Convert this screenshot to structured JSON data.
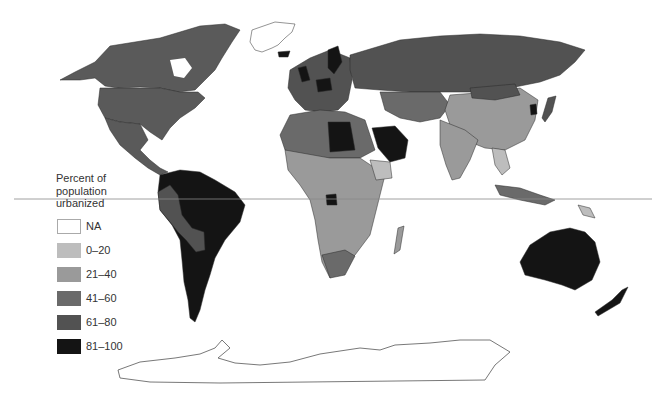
{
  "map": {
    "title": "Percent of population urbanized",
    "projection": "world (equirectangular-like)",
    "equator_line": {
      "y": 199,
      "x_start": 14,
      "x_end": 652,
      "color": "#888888"
    }
  },
  "legend": {
    "title_lines": [
      "Percent of",
      "population",
      "urbanized"
    ],
    "items": [
      {
        "label": "NA",
        "color": "#ffffff"
      },
      {
        "label": "0–20",
        "color": "#bdbdbd"
      },
      {
        "label": "21–40",
        "color": "#9a9a9a"
      },
      {
        "label": "41–60",
        "color": "#6a6a6a"
      },
      {
        "label": "61–80",
        "color": "#525252"
      },
      {
        "label": "81–100",
        "color": "#141414"
      }
    ]
  },
  "regions": [
    {
      "name": "North America (USA/Canada)",
      "class": "61–80"
    },
    {
      "name": "Mexico / Central America",
      "class": "61–80"
    },
    {
      "name": "South America (Brazil, Argentina, Venezuela, Chile)",
      "class": "81–100"
    },
    {
      "name": "Andean South America (Peru, Bolivia, Ecuador)",
      "class": "61–80"
    },
    {
      "name": "Greenland",
      "class": "NA"
    },
    {
      "name": "Antarctica",
      "class": "NA"
    },
    {
      "name": "Western Europe",
      "class": "61–80"
    },
    {
      "name": "UK / Germany / Sweden / Iceland",
      "class": "81–100"
    },
    {
      "name": "Russia",
      "class": "61–80"
    },
    {
      "name": "China",
      "class": "21–40"
    },
    {
      "name": "India / South Asia",
      "class": "21–40"
    },
    {
      "name": "Korea",
      "class": "81–100"
    },
    {
      "name": "Japan",
      "class": "61–80"
    },
    {
      "name": "Libya / Saudi Arabia",
      "class": "81–100"
    },
    {
      "name": "North Africa",
      "class": "41–60"
    },
    {
      "name": "Sub-Saharan Africa",
      "class": "21–40"
    },
    {
      "name": "East Africa (Ethiopia)",
      "class": "0–20"
    },
    {
      "name": "South Africa",
      "class": "41–60"
    },
    {
      "name": "Southeast Asia",
      "class": "21–40"
    },
    {
      "name": "Australia / New Zealand",
      "class": "81–100"
    }
  ]
}
